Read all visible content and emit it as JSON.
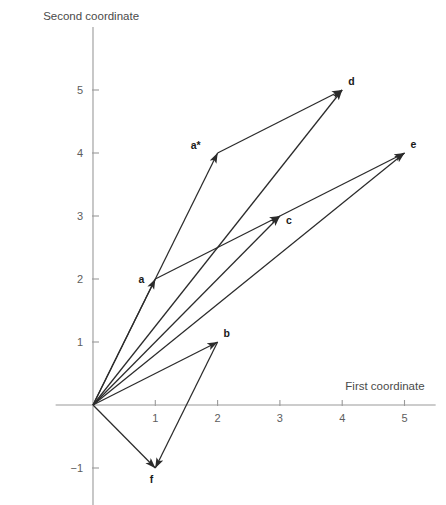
{
  "chart_data": {
    "type": "scatter",
    "title": "",
    "xlabel": "First coordinate",
    "ylabel": "Second coordinate",
    "xlim": [
      -0.6,
      5.5
    ],
    "ylim": [
      -1.6,
      6.0
    ],
    "xticks": [
      1,
      2,
      3,
      4,
      5
    ],
    "yticks": [
      1,
      2,
      3,
      4,
      5
    ],
    "xtick_labels": [
      "1",
      "2",
      "3",
      "4",
      "5"
    ],
    "ytick_labels": [
      "1",
      "2",
      "3",
      "4",
      "5"
    ],
    "grid": false,
    "legend": "none",
    "points": [
      {
        "name": "a",
        "label": "a",
        "x": 1,
        "y": 2,
        "label_dx": -11,
        "label_dy": 4
      },
      {
        "name": "a-star",
        "label": "a*",
        "x": 2,
        "y": 4,
        "label_dx": -17,
        "label_dy": -4
      },
      {
        "name": "b",
        "label": "b",
        "x": 2,
        "y": 1,
        "label_dx": 6,
        "label_dy": -5
      },
      {
        "name": "c",
        "label": "c",
        "x": 3,
        "y": 3,
        "label_dx": 6,
        "label_dy": 8
      },
      {
        "name": "d",
        "label": "d",
        "x": 4,
        "y": 5,
        "label_dx": 6,
        "label_dy": -5
      },
      {
        "name": "e",
        "label": "e",
        "x": 5,
        "y": 4,
        "label_dx": 6,
        "label_dy": -5
      },
      {
        "name": "f",
        "label": "f",
        "x": 1,
        "y": -1,
        "label_dx": -2,
        "label_dy": 15
      }
    ],
    "vectors": [
      {
        "name": "origin-to-a",
        "from": [
          0,
          0
        ],
        "to": [
          1,
          2
        ],
        "arrow": true
      },
      {
        "name": "origin-to-a-star",
        "from": [
          0,
          0
        ],
        "to": [
          2,
          4
        ],
        "arrow": true
      },
      {
        "name": "origin-to-b",
        "from": [
          0,
          0
        ],
        "to": [
          2,
          1
        ],
        "arrow": true
      },
      {
        "name": "origin-to-c",
        "from": [
          0,
          0
        ],
        "to": [
          3,
          3
        ],
        "arrow": true
      },
      {
        "name": "origin-to-d",
        "from": [
          0,
          0
        ],
        "to": [
          4,
          5
        ],
        "arrow": true
      },
      {
        "name": "origin-to-e",
        "from": [
          0,
          0
        ],
        "to": [
          5,
          4
        ],
        "arrow": true
      },
      {
        "name": "origin-to-f",
        "from": [
          0,
          0
        ],
        "to": [
          1,
          -1
        ],
        "arrow": true
      },
      {
        "name": "a-to-c",
        "from": [
          1,
          2
        ],
        "to": [
          3,
          3
        ],
        "arrow": true
      },
      {
        "name": "a-star-to-d",
        "from": [
          2,
          4
        ],
        "to": [
          4,
          5
        ],
        "arrow": true
      },
      {
        "name": "c-to-e",
        "from": [
          3,
          3
        ],
        "to": [
          5,
          4
        ],
        "arrow": true
      },
      {
        "name": "b-to-f",
        "from": [
          2,
          1
        ],
        "to": [
          1,
          -1
        ],
        "arrow": true
      }
    ],
    "colors": {
      "vector": "#2b2b2b",
      "axis": "#9a9a9a",
      "tick_label": "#5d5d5d",
      "axis_title": "#4a4a4a",
      "point_label": "#1a1a1a",
      "background": "#ffffff"
    }
  }
}
